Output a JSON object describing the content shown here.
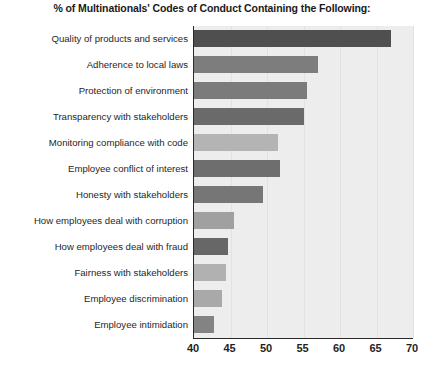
{
  "chart_data": {
    "type": "bar",
    "orientation": "horizontal",
    "title": "% of Multinationals' Codes of Conduct Containing the Following:",
    "xlabel": "",
    "ylabel": "",
    "xlim": [
      40,
      70
    ],
    "xticks": [
      40,
      45,
      50,
      55,
      60,
      65,
      70
    ],
    "grid": true,
    "legend": "none",
    "categories": [
      "Quality of products and services",
      "Adherence to local laws",
      "Protection of environment",
      "Transparency with stakeholders",
      "Monitoring compliance with code",
      "Employee conflict of interest",
      "Honesty with stakeholders",
      "How employees deal with corruption",
      "How employees deal with fraud",
      "Fairness with stakeholders",
      "Employee discrimination",
      "Employee intimidation"
    ],
    "values": [
      67,
      57,
      55.5,
      55,
      51.5,
      51.8,
      49.5,
      45.5,
      44.6,
      44.4,
      43.8,
      42.7
    ],
    "bar_colors": [
      "#4f4f4f",
      "#7d7d7d",
      "#7b7b7b",
      "#6a6a6a",
      "#b4b4b4",
      "#6e6e6e",
      "#767676",
      "#a0a0a0",
      "#676767",
      "#b1b1b1",
      "#a9a9a9",
      "#838383"
    ],
    "plot_background": "#ededed",
    "axis_color": "#2b2b2b",
    "gridline_color": "#e2e2e2"
  }
}
